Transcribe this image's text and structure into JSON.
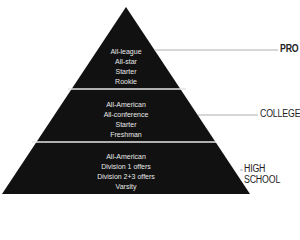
{
  "diagram": {
    "type": "pyramid",
    "colors": {
      "fill": "#111111",
      "divider": "#e6e6e6",
      "text": "#e8e8e8",
      "label": "#222222",
      "leader_line": "#999999"
    },
    "tiers": [
      {
        "label": "PRO",
        "label_bold": true,
        "items": [
          "All-league",
          "All-star",
          "Starter",
          "Rookie"
        ]
      },
      {
        "label": "COLLEGE",
        "label_bold": false,
        "items": [
          "All-American",
          "All-conference",
          "Starter",
          "Freshman"
        ]
      },
      {
        "label": "HIGH SCHOOL",
        "label_bold": false,
        "items": [
          "All-American",
          "Division 1 offers",
          "Division 2+3 offers",
          "Varsity"
        ]
      }
    ]
  }
}
